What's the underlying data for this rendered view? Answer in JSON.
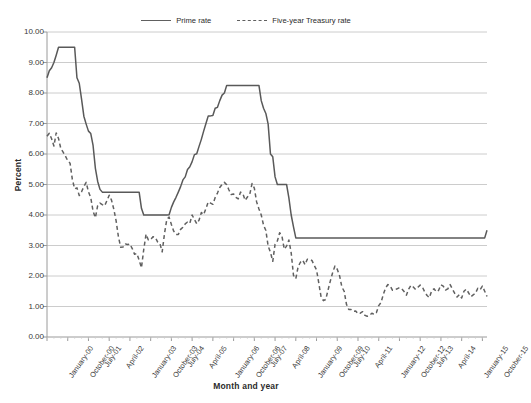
{
  "chart_data": {
    "type": "line",
    "title": "",
    "xlabel": "Month and year",
    "ylabel": "Percent",
    "ylim": [
      0,
      10
    ],
    "ytick_labels": [
      "0.00",
      "1.00",
      "2.00",
      "3.00",
      "4.00",
      "5.00",
      "6.00",
      "7.00",
      "8.00",
      "9.00",
      "10.00"
    ],
    "ytick_values": [
      0,
      1,
      2,
      3,
      4,
      5,
      6,
      7,
      8,
      9,
      10
    ],
    "grid": "horizontal",
    "legend_position": "top-center",
    "xtick_labels": [
      "January-00",
      "October-00",
      "July-01",
      "April-02",
      "January-03",
      "October-03",
      "July-04",
      "April-05",
      "January-06",
      "October-06",
      "July-07",
      "April-08",
      "January-09",
      "October-09",
      "July-10",
      "April-11",
      "January-12",
      "October-12",
      "July-13",
      "April-14",
      "January-15",
      "October-15"
    ],
    "xtick_interval_months": 9,
    "x_start": "January-00",
    "x_end": "December-15",
    "n_points": 192,
    "series": [
      {
        "name": "Prime rate",
        "style": "solid",
        "color": "#595959",
        "values": [
          8.5,
          8.73,
          8.83,
          9.0,
          9.24,
          9.5,
          9.5,
          9.5,
          9.5,
          9.5,
          9.5,
          9.5,
          9.5,
          8.5,
          8.32,
          7.8,
          7.24,
          6.98,
          6.75,
          6.67,
          6.28,
          5.53,
          5.1,
          4.84,
          4.75,
          4.75,
          4.75,
          4.75,
          4.75,
          4.75,
          4.75,
          4.75,
          4.75,
          4.75,
          4.75,
          4.75,
          4.75,
          4.75,
          4.75,
          4.75,
          4.75,
          4.22,
          4.0,
          4.0,
          4.0,
          4.0,
          4.0,
          4.0,
          4.0,
          4.0,
          4.0,
          4.0,
          4.0,
          4.01,
          4.25,
          4.43,
          4.58,
          4.75,
          4.93,
          5.15,
          5.25,
          5.49,
          5.58,
          5.75,
          5.98,
          6.01,
          6.25,
          6.48,
          6.75,
          7.0,
          7.25,
          7.25,
          7.26,
          7.5,
          7.53,
          7.75,
          7.93,
          8.0,
          8.25,
          8.25,
          8.25,
          8.25,
          8.25,
          8.25,
          8.25,
          8.25,
          8.25,
          8.25,
          8.25,
          8.25,
          8.25,
          8.25,
          8.25,
          7.75,
          7.5,
          7.33,
          6.98,
          6.0,
          5.91,
          5.25,
          5.0,
          5.0,
          5.0,
          5.0,
          5.0,
          4.56,
          4.0,
          3.61,
          3.25,
          3.25,
          3.25,
          3.25,
          3.25,
          3.25,
          3.25,
          3.25,
          3.25,
          3.25,
          3.25,
          3.25,
          3.25,
          3.25,
          3.25,
          3.25,
          3.25,
          3.25,
          3.25,
          3.25,
          3.25,
          3.25,
          3.25,
          3.25,
          3.25,
          3.25,
          3.25,
          3.25,
          3.25,
          3.25,
          3.25,
          3.25,
          3.25,
          3.25,
          3.25,
          3.25,
          3.25,
          3.25,
          3.25,
          3.25,
          3.25,
          3.25,
          3.25,
          3.25,
          3.25,
          3.25,
          3.25,
          3.25,
          3.25,
          3.25,
          3.25,
          3.25,
          3.25,
          3.25,
          3.25,
          3.25,
          3.25,
          3.25,
          3.25,
          3.25,
          3.25,
          3.25,
          3.25,
          3.25,
          3.25,
          3.25,
          3.25,
          3.25,
          3.25,
          3.25,
          3.25,
          3.25,
          3.25,
          3.25,
          3.25,
          3.25,
          3.25,
          3.25,
          3.25,
          3.25,
          3.25,
          3.25,
          3.25,
          3.5
        ]
      },
      {
        "name": "Five-year Treasury rate",
        "style": "dashed",
        "color": "#606060",
        "values": [
          6.58,
          6.68,
          6.5,
          6.26,
          6.69,
          6.51,
          6.18,
          6.06,
          5.93,
          5.78,
          5.7,
          5.17,
          4.86,
          4.89,
          4.64,
          4.76,
          4.93,
          5.07,
          4.76,
          4.57,
          4.12,
          3.91,
          4.31,
          4.39,
          4.34,
          4.3,
          4.47,
          4.65,
          4.49,
          4.19,
          3.81,
          3.29,
          2.94,
          2.95,
          3.05,
          3.03,
          3.05,
          2.9,
          2.71,
          2.74,
          2.52,
          2.27,
          2.87,
          3.37,
          3.18,
          3.19,
          3.29,
          3.27,
          3.12,
          3.07,
          2.79,
          3.39,
          3.85,
          3.93,
          3.69,
          3.47,
          3.36,
          3.36,
          3.53,
          3.6,
          3.71,
          3.77,
          3.73,
          4.0,
          3.85,
          3.71,
          3.83,
          4.08,
          4.01,
          4.21,
          4.43,
          4.39,
          4.35,
          4.57,
          4.72,
          4.9,
          5.0,
          5.07,
          4.99,
          4.82,
          4.67,
          4.69,
          4.58,
          4.53,
          4.75,
          4.71,
          4.48,
          4.59,
          4.67,
          5.03,
          4.88,
          4.43,
          4.2,
          4.0,
          3.67,
          3.49,
          2.98,
          2.78,
          2.48,
          3.04,
          3.15,
          3.42,
          3.3,
          2.88,
          2.98,
          3.18,
          2.76,
          2.02,
          1.91,
          2.3,
          2.45,
          2.52,
          2.37,
          2.55,
          2.54,
          2.51,
          2.35,
          2.2,
          1.76,
          1.3,
          1.19,
          1.23,
          1.54,
          1.84,
          2.11,
          2.33,
          2.22,
          2.01,
          1.64,
          1.5,
          1.07,
          0.9,
          0.9,
          0.84,
          0.85,
          0.76,
          0.78,
          0.83,
          0.71,
          0.68,
          0.71,
          0.78,
          0.74,
          0.8,
          1.03,
          1.13,
          1.4,
          1.61,
          1.72,
          1.67,
          1.53,
          1.55,
          1.58,
          1.62,
          1.58,
          1.49,
          1.37,
          1.57,
          1.7,
          1.64,
          1.56,
          1.63,
          1.7,
          1.63,
          1.47,
          1.36,
          1.29,
          1.52,
          1.58,
          1.48,
          1.53,
          1.71,
          1.67,
          1.54,
          1.58,
          1.72,
          1.57,
          1.43,
          1.31,
          1.39,
          1.28,
          1.5,
          1.57,
          1.45,
          1.32,
          1.38,
          1.43,
          1.6,
          1.55,
          1.67,
          1.5,
          1.33
        ]
      }
    ]
  },
  "legend": {
    "prime_label": "Prime rate",
    "treasury_label": "Five-year Treasury rate"
  },
  "axes": {
    "y_title": "Percent",
    "x_title": "Month and year"
  }
}
